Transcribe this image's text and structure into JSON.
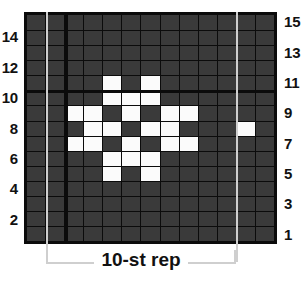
{
  "chart_data": {
    "type": "heatmap",
    "title": "",
    "subtitle": "",
    "xlabel": "10-st rep",
    "ylabel": "",
    "grid": true,
    "legend_position": "none",
    "columns": 13,
    "rows": 15,
    "colors": {
      "background": "#ffffff",
      "cell_off": "#3a3a3a",
      "cell_on": "#fbfbfb",
      "gridline": "#0b0b0b",
      "border": "#0b0b0b",
      "repeat_guide": "#cfcfcf",
      "label_text": "#111111"
    },
    "cell_values": {
      "off": 0,
      "on": 1
    },
    "row_order": "bottom-to-top",
    "rows_data": [
      {
        "row": 1,
        "cells": [
          0,
          0,
          0,
          0,
          0,
          0,
          0,
          0,
          0,
          0,
          0,
          0,
          0
        ]
      },
      {
        "row": 2,
        "cells": [
          0,
          0,
          0,
          0,
          0,
          0,
          0,
          0,
          0,
          0,
          0,
          0,
          0
        ]
      },
      {
        "row": 3,
        "cells": [
          0,
          0,
          0,
          0,
          0,
          0,
          0,
          0,
          0,
          0,
          0,
          0,
          0
        ]
      },
      {
        "row": 4,
        "cells": [
          0,
          0,
          0,
          0,
          0,
          0,
          0,
          0,
          0,
          0,
          0,
          0,
          0
        ]
      },
      {
        "row": 5,
        "cells": [
          0,
          0,
          0,
          0,
          1,
          0,
          1,
          0,
          0,
          0,
          0,
          0,
          0
        ]
      },
      {
        "row": 6,
        "cells": [
          0,
          0,
          0,
          0,
          1,
          1,
          1,
          0,
          0,
          0,
          0,
          0,
          0
        ]
      },
      {
        "row": 7,
        "cells": [
          0,
          0,
          1,
          1,
          0,
          1,
          0,
          1,
          1,
          0,
          0,
          0,
          0
        ]
      },
      {
        "row": 8,
        "cells": [
          0,
          0,
          0,
          1,
          1,
          0,
          1,
          1,
          0,
          0,
          0,
          1,
          0
        ]
      },
      {
        "row": 9,
        "cells": [
          0,
          0,
          1,
          1,
          0,
          1,
          0,
          1,
          1,
          0,
          0,
          0,
          0
        ]
      },
      {
        "row": 10,
        "cells": [
          0,
          0,
          0,
          0,
          1,
          1,
          1,
          0,
          0,
          0,
          0,
          0,
          0
        ]
      },
      {
        "row": 11,
        "cells": [
          0,
          0,
          0,
          0,
          1,
          0,
          1,
          0,
          0,
          0,
          0,
          0,
          0
        ]
      },
      {
        "row": 12,
        "cells": [
          0,
          0,
          0,
          0,
          0,
          0,
          0,
          0,
          0,
          0,
          0,
          0,
          0
        ]
      },
      {
        "row": 13,
        "cells": [
          0,
          0,
          0,
          0,
          0,
          0,
          0,
          0,
          0,
          0,
          0,
          0,
          0
        ]
      },
      {
        "row": 14,
        "cells": [
          0,
          0,
          0,
          0,
          0,
          0,
          0,
          0,
          0,
          0,
          0,
          0,
          0
        ]
      },
      {
        "row": 15,
        "cells": [
          0,
          0,
          0,
          0,
          0,
          0,
          0,
          0,
          0,
          0,
          0,
          0,
          0
        ]
      }
    ],
    "row_labels_left": [
      "",
      "2",
      "",
      "4",
      "",
      "6",
      "",
      "8",
      "",
      "10",
      "",
      "12",
      "",
      "14",
      ""
    ],
    "row_labels_right": [
      "1",
      "",
      "3",
      "",
      "5",
      "",
      "7",
      "",
      "9",
      "",
      "11",
      "",
      "13",
      "",
      "15"
    ],
    "repeat": {
      "label": "10-st rep",
      "start_column": 2,
      "end_column": 11,
      "stitch_count": 10
    },
    "emphasis_lines": {
      "horizontal_above_row": 10,
      "vertical_after_column": 2
    }
  }
}
